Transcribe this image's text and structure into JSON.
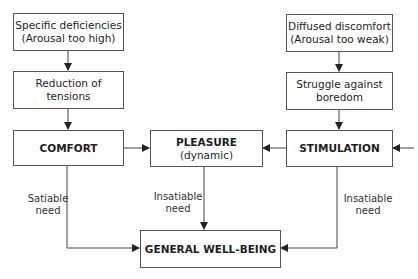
{
  "diagram": {
    "boxes": {
      "specific_deficiencies": {
        "line1": "Specific deficiencies",
        "line2": "(Arousal too high)"
      },
      "reduction_tensions": {
        "line1": "Reduction of tensions"
      },
      "comfort": {
        "line1": "COMFORT"
      },
      "pleasure": {
        "line1": "PLEASURE",
        "line2": "(dynamic)"
      },
      "stimulation": {
        "line1": "STIMULATION"
      },
      "diffused_discomfort": {
        "line1": "Diffused discomfort",
        "line2": "(Arousal too weak)"
      },
      "struggle_boredom": {
        "line1": "Struggle against",
        "line2": "boredom"
      },
      "general_wellbeing": {
        "line1": "GENERAL WELL-BEING"
      }
    },
    "edge_labels": {
      "comfort_to_wellbeing": {
        "line1": "Satiable",
        "line2": "need"
      },
      "pleasure_to_wellbeing": {
        "line1": "Insatiable",
        "line2": "need"
      },
      "stimulation_to_wellbeing": {
        "line1": "Insatiable",
        "line2": "need"
      }
    },
    "edges": [
      {
        "from": "Specific deficiencies",
        "to": "Reduction of tensions"
      },
      {
        "from": "Reduction of tensions",
        "to": "COMFORT"
      },
      {
        "from": "Diffused discomfort",
        "to": "Struggle against boredom"
      },
      {
        "from": "Struggle against boredom",
        "to": "STIMULATION"
      },
      {
        "from": "COMFORT",
        "to": "PLEASURE"
      },
      {
        "from": "STIMULATION",
        "to": "PLEASURE"
      },
      {
        "from": "external",
        "to": "STIMULATION"
      },
      {
        "from": "COMFORT",
        "to": "GENERAL WELL-BEING",
        "label": "Satiable need"
      },
      {
        "from": "PLEASURE",
        "to": "GENERAL WELL-BEING",
        "label": "Insatiable need"
      },
      {
        "from": "STIMULATION",
        "to": "GENERAL WELL-BEING",
        "label": "Insatiable need"
      }
    ],
    "colors": {
      "line": "#444444",
      "text": "#1e1e1e",
      "background": "#ffffff"
    }
  }
}
